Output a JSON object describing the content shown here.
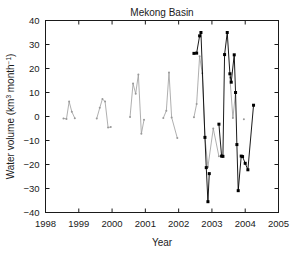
{
  "chart_data": {
    "type": "line",
    "title": "Mekong Basin",
    "xlabel": "Year",
    "ylabel": "Water volume (km3 month-1)",
    "ylabel_parts": {
      "main": "Water volume (km",
      "sup1": "3",
      "mid": " month",
      "sup2": "−1",
      "tail": ")"
    },
    "xlim": [
      1998,
      2005
    ],
    "ylim": [
      -40,
      40
    ],
    "xticks": [
      1998,
      1999,
      2000,
      2001,
      2002,
      2003,
      2004,
      2005
    ],
    "xtick_labels": [
      "1998",
      "1999",
      "2000",
      "2001",
      "2002",
      "2003",
      "2004",
      "2005"
    ],
    "yticks": [
      -40,
      -30,
      -20,
      -10,
      0,
      10,
      20,
      30,
      40
    ],
    "ytick_labels": [
      "−40",
      "−30",
      "−20",
      "−10",
      "0",
      "10",
      "20",
      "30",
      "40"
    ],
    "grid": false,
    "legend": "none",
    "box": true,
    "series": [
      {
        "name": "gravimetric-gray",
        "color": "#9a9a9a",
        "marker": "dot",
        "marker_size": 2.0,
        "line_width": 0.8,
        "points": [
          [
            1998.54,
            -0.8
          ],
          [
            1998.63,
            -1.0
          ],
          [
            1998.71,
            6.2
          ],
          [
            1998.79,
            2.0
          ],
          [
            1998.88,
            -0.7
          ],
          [
            1999.54,
            -0.8
          ],
          [
            1999.63,
            3.6
          ],
          [
            1999.71,
            7.3
          ],
          [
            1999.79,
            6.2
          ],
          [
            1999.88,
            -4.6
          ],
          [
            1999.96,
            -4.4
          ],
          [
            2000.54,
            -0.2
          ],
          [
            2000.63,
            13.7
          ],
          [
            2000.71,
            9.5
          ],
          [
            2000.79,
            17.5
          ],
          [
            2000.88,
            -7.2
          ],
          [
            2000.96,
            -1.4
          ],
          [
            2001.54,
            -0.6
          ],
          [
            2001.63,
            2.4
          ],
          [
            2001.71,
            18.3
          ],
          [
            2001.79,
            -0.4
          ],
          [
            2001.96,
            -9.0
          ],
          [
            2002.46,
            -0.3
          ],
          [
            2002.54,
            5.2
          ],
          [
            2002.63,
            25.1
          ],
          [
            2002.71,
            18.0
          ],
          [
            2002.79,
            -8.8
          ],
          [
            2002.88,
            -21.0
          ],
          [
            2003.04,
            -5.0
          ],
          [
            2003.21,
            -16.6
          ],
          [
            2003.54,
            16.2
          ],
          [
            2003.63,
            -0.6
          ],
          [
            2003.71,
            10.0
          ],
          [
            2003.96,
            -1.1
          ]
        ]
      },
      {
        "name": "altimetric-black",
        "color": "#000000",
        "marker": "square",
        "marker_size": 3.0,
        "line_width": 0.9,
        "points": [
          [
            2002.46,
            26.3
          ],
          [
            2002.54,
            26.4
          ],
          [
            2002.63,
            33.6
          ],
          [
            2002.67,
            35.0
          ],
          [
            2002.79,
            -8.7
          ],
          [
            2002.83,
            -21.3
          ],
          [
            2002.88,
            -35.5
          ],
          [
            2002.92,
            -23.8
          ],
          [
            2003.21,
            -3.2
          ],
          [
            2003.29,
            -16.5
          ],
          [
            2003.33,
            -16.6
          ],
          [
            2003.38,
            25.8
          ],
          [
            2003.46,
            35.0
          ],
          [
            2003.54,
            17.8
          ],
          [
            2003.58,
            14.3
          ],
          [
            2003.67,
            25.7
          ],
          [
            2003.71,
            10.0
          ],
          [
            2003.75,
            -11.7
          ],
          [
            2003.79,
            -30.9
          ],
          [
            2003.88,
            -16.5
          ],
          [
            2003.92,
            -16.7
          ],
          [
            2004.0,
            -19.5
          ],
          [
            2004.08,
            -22.2
          ],
          [
            2004.25,
            4.7
          ]
        ]
      }
    ]
  }
}
